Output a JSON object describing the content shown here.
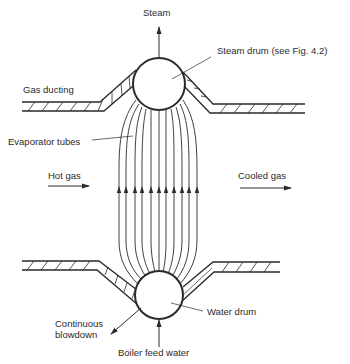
{
  "figure": {
    "labels": {
      "steam": "Steam",
      "steam_drum": "Steam drum (see Fig. 4.2)",
      "gas_ducting": "Gas ducting",
      "evaporator_tubes": "Evaporator tubes",
      "hot_gas": "Hot gas",
      "cooled_gas": "Cooled gas",
      "water_drum": "Water drum",
      "continuous_blowdown_line1": "Continuous",
      "continuous_blowdown_line2": "blowdown",
      "boiler_feed_water": "Boiler feed water"
    },
    "tube_count": 11,
    "colors": {
      "ink": "#2a2a2a",
      "background": "#ffffff"
    }
  }
}
